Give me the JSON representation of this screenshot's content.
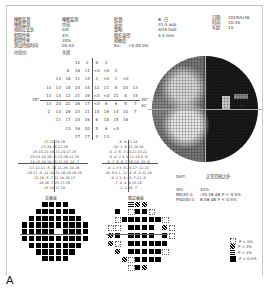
{
  "report": {
    "left_header": [
      {
        "label": "睡眠监测",
        "value": "睡眠监测"
      },
      {
        "label": "睡眠监测",
        "value": "中央"
      },
      {
        "label": "视固定丢失",
        "value": "0/0"
      },
      {
        "label": "假阳性率",
        "value": "4%"
      },
      {
        "label": "假阴性率",
        "value": "30%"
      },
      {
        "label": "测试持续时间",
        "value": "05:52"
      }
    ],
    "center_header": [
      {
        "label": "检测:",
        "value": "Ⅲ, 白"
      },
      {
        "label": "背景:",
        "value": "31.5 asb"
      },
      {
        "label": "策略:",
        "value": "SITA Fast"
      },
      {
        "label": "瞳孔直径:",
        "value": "4.4 mm"
      },
      {
        "label": "视敏度:",
        "value": ""
      },
      {
        "label": "Rx:",
        "value": "+0.00 DS"
      }
    ],
    "right_header": [
      {
        "label": "日期:",
        "value": "2019/5/16"
      },
      {
        "label": "时间:",
        "value": "10:35"
      },
      {
        "label": "年龄:",
        "value": "15"
      }
    ],
    "fovea_label": "中央凹:",
    "fovea_value": "关闭",
    "axis_label_left": "30°",
    "axis_label_right": "30°",
    "map_axis_left": "30°",
    "map_axis_right": "30°",
    "numeric_rows": [
      [
        "12",
        "2",
        "6",
        "2"
      ],
      [
        "8",
        "18",
        "11",
        "<0",
        "<0",
        "2"
      ],
      [
        "14",
        "18",
        "11",
        "14",
        "1",
        "<0",
        "1",
        "<0"
      ],
      [
        "13",
        "13",
        "18",
        "24",
        "14",
        "12",
        "11",
        "8",
        "20",
        "13"
      ],
      [
        "13",
        "14",
        "12",
        "21",
        "16",
        "<0",
        "<0",
        "22",
        "8",
        "14"
      ],
      [
        "13",
        "20",
        "22",
        "26",
        "17",
        "<0",
        "6",
        "6",
        "5",
        "7"
      ],
      [
        "2",
        "14",
        "26",
        "23",
        "11",
        "14",
        "16",
        "14",
        "10",
        "7"
      ],
      [
        "11",
        "17",
        "24",
        "16",
        "6",
        "18",
        "15",
        "16"
      ],
      [
        "13",
        "16",
        "20",
        "5",
        "6",
        "<0"
      ],
      [
        "17",
        "17",
        "4",
        "13"
      ]
    ],
    "total_deviation_rows": [
      "-17-21-25-26",
      "-23-19-26-22-26",
      "-15-14-21-19-21-24-17-25",
      "-15-15-15-19-23-22-26-12-20",
      "-14-15-18-18-20-22-26 -24 -7",
      "-17-12-11 -5 -14-21-26 -24-26",
      "-20-17 -8 -11-24-21-16-20-26-26",
      "-21-16 -5 -7-21-18-26-17",
      "-18-16 -7-25-27-26",
      "-15-14-17-16"
    ],
    "pattern_deviation_rows": [
      "-6 -6-12-14",
      "-10 -1 -6-11-20-16",
      "-4 -2 -6 -7-20-22-15-22",
      "-4 -4 -2 4 -9-11-15-5 -6",
      "-4 -7 -6 -6 -7-20-28 -15 -6",
      "-4 -1 3 5 -6-24-17 -12-13",
      "-16 -6 0 1 -12 -4 -6 -4-11-14",
      "-8 -2 3 -6-10 -7-11 -6",
      "-7 -4 -4 -8-15-20",
      "-1 -2-16 -7"
    ],
    "total_deviation_title": "总偏差",
    "pattern_deviation_title": "模式偏差",
    "prob_map_title_1": "总偏差",
    "prob_map_title_2": "模式偏差",
    "ght_label": "GHT:",
    "ght_value": "正常范围之外",
    "vfi_label": "VFI:",
    "vfi_value": "42%",
    "md_label": "MD30-2:",
    "md_value": "-20.18 dB P < 0.5%",
    "psd_label": "PSD30-2:",
    "psd_value": "8.58 dB P < 0.5%",
    "legend": [
      {
        "symbol": "dotted-square",
        "label": "P < 5%"
      },
      {
        "symbol": "light-hatch",
        "label": "P < 2%"
      },
      {
        "symbol": "dense-hatch",
        "label": "P < 1%"
      },
      {
        "symbol": "solid-black",
        "label": "P < 0.5%"
      }
    ],
    "figure_letter": "A"
  }
}
